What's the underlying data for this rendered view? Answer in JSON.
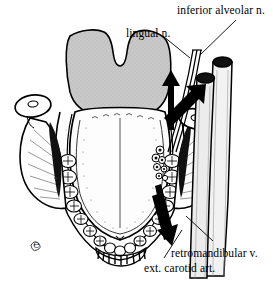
{
  "figure": {
    "kind": "anatomical-illustration",
    "background_color": "#ffffff",
    "ink_color": "#000000",
    "shade_color": "#c9c9c9",
    "width": 273,
    "height": 283
  },
  "labels": [
    {
      "id": "inferior-alveolar-nerve",
      "text": "inferior alveolar n.",
      "x": 177,
      "y": 4,
      "leader": "diagonal line running down-left to the nerve bundle"
    },
    {
      "id": "lingual-nerve",
      "text": "lingual n.",
      "x": 126,
      "y": 27,
      "leader": "short diagonal line running down-right to the nerve bundle"
    },
    {
      "id": "retromandibular-vein",
      "text": "retromandibular v.",
      "x": 171,
      "y": 247,
      "leader": "diagonal line running up-left to the posterior cut vessel"
    },
    {
      "id": "external-carotid-artery",
      "text": "ext. carotid art.",
      "x": 144,
      "y": 262,
      "leader": "diagonal line running up-right to the anterior cut vessel"
    }
  ],
  "structures": [
    {
      "id": "tongue-body",
      "name": "tongue / floor of mouth"
    },
    {
      "id": "pharynx-shaded-region",
      "name": "shaded posterior oropharyngeal region"
    },
    {
      "id": "dental-arch",
      "name": "mandibular dental arch"
    },
    {
      "id": "left-condyle",
      "name": "left mandibular condyle"
    },
    {
      "id": "right-condyle",
      "name": "right mandibular condyle"
    },
    {
      "id": "left-ramus",
      "name": "left mandibular ramus"
    },
    {
      "id": "right-ramus",
      "name": "right mandibular ramus"
    },
    {
      "id": "nerve-bundle",
      "name": "lingual and inferior alveolar nerve trunks"
    },
    {
      "id": "vessel-retromandibular",
      "name": "cut retromandibular vein cylinder"
    },
    {
      "id": "vessel-carotid",
      "name": "cut external carotid artery cylinder"
    },
    {
      "id": "arrow-up",
      "name": "upward black arrow"
    },
    {
      "id": "arrow-up-right",
      "name": "upward-right black arrow"
    },
    {
      "id": "arrow-down",
      "name": "downward black arrow"
    },
    {
      "id": "artist-monogram",
      "name": "artist monogram signature"
    }
  ]
}
